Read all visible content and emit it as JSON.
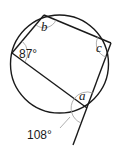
{
  "diagram": {
    "circle": {
      "cx": 59.5,
      "cy": 64,
      "r": 49
    },
    "vertices": {
      "top": {
        "x": 44,
        "y": 15
      },
      "left": {
        "x": 12,
        "y": 53
      },
      "right": {
        "x": 111,
        "y": 43
      },
      "bottom": {
        "x": 87,
        "y": 108
      },
      "extension_end": {
        "x": 73,
        "y": 145
      }
    },
    "labels": {
      "angle_left": "87°",
      "angle_top": "b",
      "angle_right": "c",
      "angle_bottom": "a",
      "angle_exterior": "108°"
    },
    "colors": {
      "line": "#1a1a1a",
      "arc": "#9a9a9a",
      "background": "#ffffff"
    }
  }
}
